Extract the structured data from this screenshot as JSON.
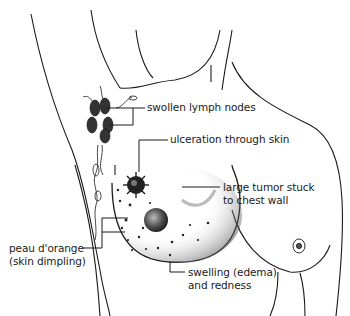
{
  "diagram": {
    "labels": {
      "lymph": "swollen lymph nodes",
      "ulcer": "ulceration through skin",
      "tumor_line1": "large tumor stuck",
      "tumor_line2": "to chest wall",
      "peau_line1": "peau d'orange",
      "peau_line2": "(skin dimpling)",
      "swelling_line1": "swelling (edema)",
      "swelling_line2": "and redness"
    },
    "colors": {
      "line": "#1a1a1a",
      "background": "#ffffff",
      "shading": "#333333"
    }
  }
}
